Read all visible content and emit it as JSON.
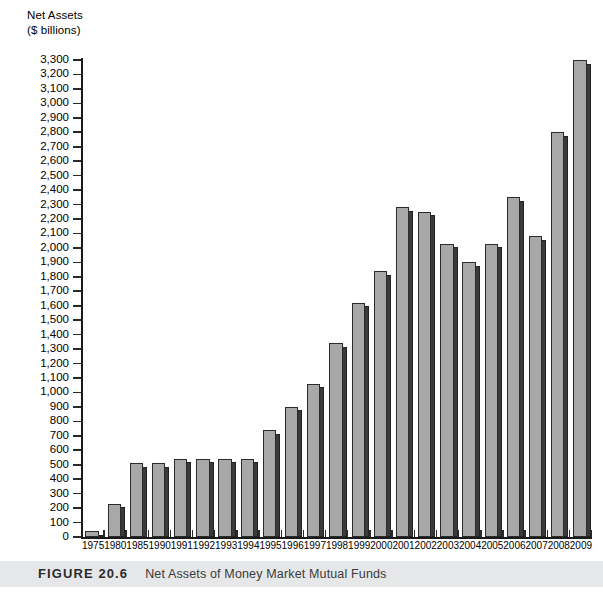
{
  "figure": {
    "number_label": "FIGURE 20.6",
    "caption": "Net Assets of Money Market Mutual Funds"
  },
  "axis_title": {
    "line1": "Net Assets",
    "line2": "($ billions)"
  },
  "colors": {
    "bar_face": "#a8a8a8",
    "bar_side": "#3a3a3a",
    "bar_outline": "#2b2b2b",
    "axis": "#1a1a1a",
    "caption_band": "#e6e7e8",
    "plot_background": "#ffffff"
  },
  "chart_data": {
    "type": "bar",
    "title": "Net Assets of Money Market Mutual Funds",
    "xlabel": "",
    "ylabel": "Net Assets ($ billions)",
    "ylim": [
      0,
      3300
    ],
    "ytick_step": 100,
    "grid": false,
    "legend": null,
    "ytick_labels": [
      "3,300",
      "3,200",
      "3,100",
      "3,000",
      "2,900",
      "2,800",
      "2,700",
      "2,600",
      "2,500",
      "2,400",
      "2,300",
      "2,200",
      "2,100",
      "2,000",
      "1,900",
      "1,800",
      "1,700",
      "1,600",
      "1,500",
      "1,400",
      "1,300",
      "1,200",
      "1,100",
      "1,000",
      "900",
      "800",
      "700",
      "600",
      "500",
      "400",
      "300",
      "200",
      "100",
      "0"
    ],
    "categories": [
      "1975",
      "1980",
      "1985",
      "1990",
      "1991",
      "1992",
      "1993",
      "1994",
      "1995",
      "1996",
      "1997",
      "1998",
      "1999",
      "2000",
      "2001",
      "2002",
      "2003",
      "2004",
      "2005",
      "2006",
      "2007",
      "2008",
      "2009"
    ],
    "values": [
      40,
      230,
      510,
      510,
      540,
      540,
      540,
      540,
      740,
      900,
      1060,
      1340,
      1620,
      1840,
      2280,
      2250,
      2030,
      1900,
      2030,
      2350,
      2080,
      2800,
      3300
    ]
  }
}
